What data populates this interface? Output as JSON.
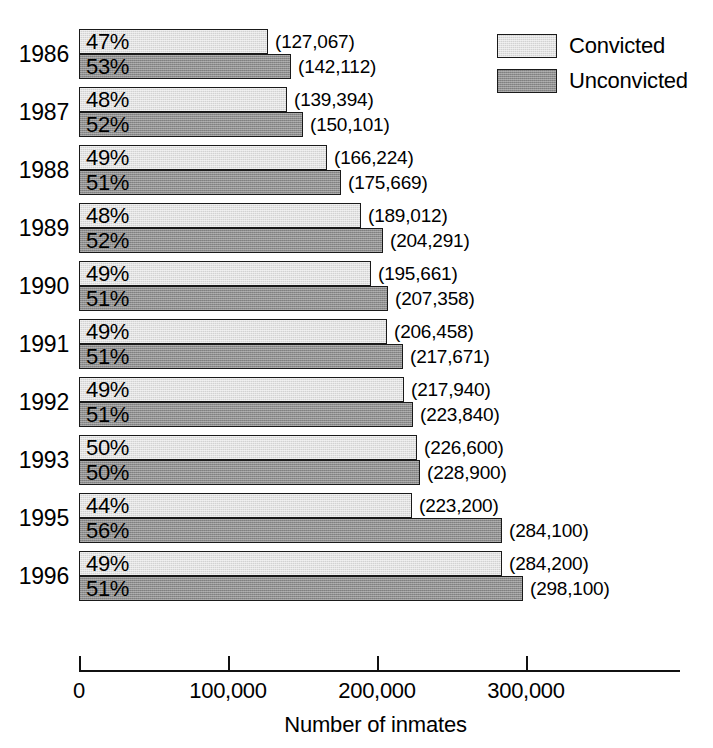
{
  "chart_data": {
    "type": "bar",
    "orientation": "horizontal",
    "title": "",
    "xlabel": "Number of inmates",
    "ylabel": "",
    "xlim": [
      0,
      400000
    ],
    "xticks": [
      0,
      100000,
      200000,
      300000
    ],
    "xtick_labels": [
      "0",
      "100,000",
      "200,000",
      "300,000"
    ],
    "grid": false,
    "legend_position": "top-right",
    "categories": [
      "1986",
      "1987",
      "1988",
      "1989",
      "1990",
      "1991",
      "1992",
      "1993",
      "1995",
      "1996"
    ],
    "series": [
      {
        "name": "Convicted",
        "color": "#d2d2d2",
        "values": [
          127067,
          139394,
          166224,
          189012,
          195661,
          206458,
          217940,
          226600,
          223200,
          284200
        ],
        "value_labels": [
          "(127,067)",
          "(139,394)",
          "(166,224)",
          "(189,012)",
          "(195,661)",
          "(206,458)",
          "(217,940)",
          "(226,600)",
          "(223,200)",
          "(284,200)"
        ],
        "percent_labels": [
          "47%",
          "48%",
          "49%",
          "48%",
          "49%",
          "49%",
          "49%",
          "50%",
          "44%",
          "49%"
        ],
        "percents": [
          47,
          48,
          49,
          48,
          49,
          49,
          49,
          50,
          44,
          49
        ]
      },
      {
        "name": "Unconvicted",
        "color": "#8e8e8e",
        "values": [
          142112,
          150101,
          175669,
          204291,
          207358,
          217671,
          223840,
          228900,
          284100,
          298100
        ],
        "value_labels": [
          "(142,112)",
          "(150,101)",
          "(175,669)",
          "(204,291)",
          "(207,358)",
          "(217,671)",
          "(223,840)",
          "(228,900)",
          "(284,100)",
          "(298,100)"
        ],
        "percent_labels": [
          "53%",
          "52%",
          "51%",
          "52%",
          "51%",
          "51%",
          "51%",
          "50%",
          "56%",
          "51%"
        ],
        "percents": [
          53,
          52,
          51,
          52,
          51,
          51,
          51,
          50,
          56,
          51
        ]
      }
    ]
  },
  "legend": {
    "items": [
      {
        "label": "Convicted",
        "key": "convicted"
      },
      {
        "label": "Unconvicted",
        "key": "unconvicted"
      }
    ]
  },
  "axis": {
    "title": "Number of inmates"
  }
}
